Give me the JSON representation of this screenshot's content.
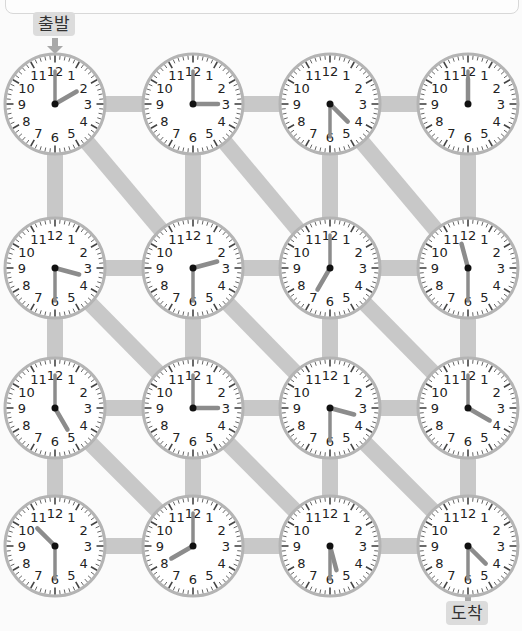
{
  "start_label": "출발",
  "end_label": "도착",
  "colors": {
    "path": "#c8c8c8",
    "clock_rim": "#b4b4b4",
    "clock_face": "#ffffff",
    "hand": "#8c8c8c",
    "numeral": "#222222",
    "tag_bg": "#dcdcdc",
    "arrow": "#a8a8a8"
  },
  "grid": {
    "cols_x": [
      55,
      193,
      330,
      468
    ],
    "rows_y": [
      104,
      268,
      408,
      546
    ],
    "radius": 50
  },
  "clocks": [
    [
      {
        "hour": 2,
        "minute": 0,
        "label": "2:00"
      },
      {
        "hour": 3,
        "minute": 0,
        "label": "3:00"
      },
      {
        "hour": 4,
        "minute": 30,
        "label": "4:30"
      },
      {
        "hour": 12,
        "minute": 0,
        "label": "12:00"
      }
    ],
    [
      {
        "hour": 3,
        "minute": 30,
        "label": "3:30"
      },
      {
        "hour": 2,
        "minute": 30,
        "label": "2:30"
      },
      {
        "hour": 7,
        "minute": 0,
        "label": "7:00"
      },
      {
        "hour": 11,
        "minute": 30,
        "label": "11:30"
      }
    ],
    [
      {
        "hour": 5,
        "minute": 0,
        "label": "5:00"
      },
      {
        "hour": 3,
        "minute": 0,
        "label": "3:00"
      },
      {
        "hour": 3,
        "minute": 30,
        "label": "3:30"
      },
      {
        "hour": 4,
        "minute": 0,
        "label": "4:00"
      }
    ],
    [
      {
        "hour": 10,
        "minute": 30,
        "label": "10:30"
      },
      {
        "hour": 8,
        "minute": 0,
        "label": "8:00"
      },
      {
        "hour": 5,
        "minute": 30,
        "label": "5:30"
      },
      {
        "hour": 4,
        "minute": 30,
        "label": "4:30"
      }
    ]
  ],
  "diagonals": [
    [
      0,
      0,
      1,
      1
    ],
    [
      0,
      1,
      1,
      2
    ],
    [
      0,
      2,
      1,
      3
    ],
    [
      1,
      0,
      2,
      1
    ],
    [
      1,
      1,
      2,
      2
    ],
    [
      1,
      2,
      2,
      3
    ],
    [
      2,
      0,
      3,
      1
    ],
    [
      2,
      1,
      3,
      2
    ],
    [
      2,
      2,
      3,
      3
    ]
  ],
  "numerals": [
    "12",
    "1",
    "2",
    "3",
    "4",
    "5",
    "6",
    "7",
    "8",
    "9",
    "10",
    "11"
  ]
}
